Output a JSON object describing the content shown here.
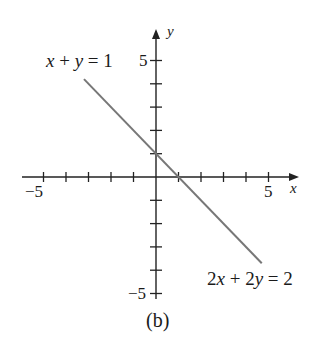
{
  "chart_data": {
    "type": "line",
    "title": "",
    "subtitle": "(b)",
    "xlabel": "x",
    "ylabel": "y",
    "xlim": [
      -5,
      6
    ],
    "ylim": [
      -5,
      6
    ],
    "x_ticks": [
      -5,
      -4,
      -3,
      -2,
      -1,
      1,
      2,
      3,
      4,
      5
    ],
    "y_ticks": [
      -5,
      -4,
      -3,
      -2,
      -1,
      1,
      2,
      3,
      4,
      5
    ],
    "x_tick_labels": [
      {
        "value": -5,
        "label": "−5"
      },
      {
        "value": 5,
        "label": "5"
      }
    ],
    "y_tick_labels": [
      {
        "value": 5,
        "label": "5"
      },
      {
        "value": -5,
        "label": "−5"
      }
    ],
    "grid": false,
    "series": [
      {
        "name": "x + y = 1 (same line as 2x + 2y = 2)",
        "x": [
          -3.2,
          4.7
        ],
        "y": [
          4.2,
          -3.7
        ],
        "color": "#777777"
      }
    ],
    "annotations": [
      {
        "text": "x + y = 1",
        "position": "upper-left end of line"
      },
      {
        "text": "2x + 2y = 2",
        "position": "lower-right end of line"
      }
    ]
  },
  "labels": {
    "eq_top": "x + y = 1",
    "eq_bottom": "2x + 2y = 2",
    "x_axis": "x",
    "y_axis": "y",
    "x_neg5": "−5",
    "x_pos5": "5",
    "y_pos5": "5",
    "y_neg5": "−5",
    "caption": "(b)"
  },
  "colors": {
    "axis": "#222222",
    "line": "#777777",
    "text": "#1a1a1a"
  }
}
